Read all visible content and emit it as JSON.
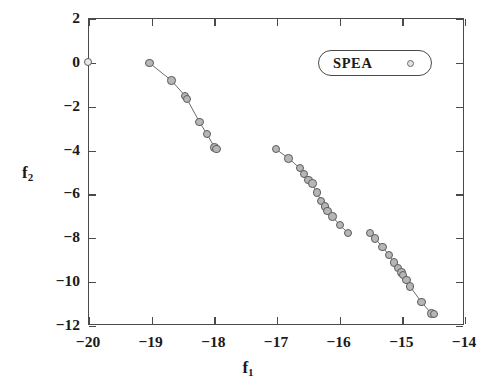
{
  "chart_data": {
    "type": "scatter",
    "title": "",
    "xlabel": "f_1",
    "ylabel": "f_2",
    "xlabel_base": "f",
    "xlabel_sub": "1",
    "ylabel_base": "f",
    "ylabel_sub": "2",
    "xlim": [
      -20,
      -14
    ],
    "ylim": [
      -12,
      2
    ],
    "xticks": [
      -20,
      -19,
      -18,
      -17,
      -16,
      -15,
      -14
    ],
    "xtick_labels": [
      "-20",
      "-19",
      "-18",
      "-17",
      "-16",
      "-15",
      "-14"
    ],
    "yticks": [
      2,
      0,
      -2,
      -4,
      -6,
      -8,
      -10,
      -12
    ],
    "ytick_labels": [
      "2",
      "0",
      "-2",
      "-4",
      "-6",
      "-8",
      "-10",
      "-12"
    ],
    "grid": false,
    "legend": {
      "position": "top-right",
      "entries": [
        {
          "name": "SPEA",
          "marker": "circle",
          "marker_color": "#e2e2e2"
        }
      ]
    },
    "marker_style": {
      "shape": "circle",
      "fill": "#b6b6b6",
      "edge": "#5d5d5d",
      "size_px": 8.4
    },
    "line_style": {
      "color": "#6b6b6b",
      "width": 1.0
    },
    "series": [
      {
        "name": "SPEA",
        "segments": [
          {
            "id": "isolated-origin",
            "connected": false,
            "points": [
              {
                "x": -20.0,
                "y": 0.0
              }
            ]
          },
          {
            "id": "segment-1",
            "connected": true,
            "points": [
              {
                "x": -19.02,
                "y": -0.05
              },
              {
                "x": -18.67,
                "y": -0.85
              },
              {
                "x": -18.45,
                "y": -1.55
              },
              {
                "x": -18.42,
                "y": -1.7
              },
              {
                "x": -18.22,
                "y": -2.75
              },
              {
                "x": -18.1,
                "y": -3.3
              },
              {
                "x": -17.98,
                "y": -3.9
              },
              {
                "x": -17.95,
                "y": -3.98
              }
            ]
          },
          {
            "id": "segment-2",
            "connected": true,
            "points": [
              {
                "x": -17.0,
                "y": -3.98
              },
              {
                "x": -16.8,
                "y": -4.4
              },
              {
                "x": -16.62,
                "y": -4.85
              },
              {
                "x": -16.55,
                "y": -5.1
              },
              {
                "x": -16.48,
                "y": -5.4
              },
              {
                "x": -16.42,
                "y": -5.55
              },
              {
                "x": -16.35,
                "y": -5.95
              },
              {
                "x": -16.28,
                "y": -6.35
              },
              {
                "x": -16.22,
                "y": -6.6
              },
              {
                "x": -16.18,
                "y": -6.8
              },
              {
                "x": -16.1,
                "y": -7.05
              },
              {
                "x": -15.98,
                "y": -7.45
              },
              {
                "x": -15.85,
                "y": -7.8
              }
            ]
          },
          {
            "id": "segment-3",
            "connected": true,
            "points": [
              {
                "x": -15.5,
                "y": -7.8
              },
              {
                "x": -15.42,
                "y": -8.05
              },
              {
                "x": -15.3,
                "y": -8.45
              },
              {
                "x": -15.2,
                "y": -8.8
              },
              {
                "x": -15.12,
                "y": -9.15
              },
              {
                "x": -15.05,
                "y": -9.4
              },
              {
                "x": -15.0,
                "y": -9.6
              },
              {
                "x": -14.97,
                "y": -9.72
              },
              {
                "x": -14.92,
                "y": -9.95
              },
              {
                "x": -14.86,
                "y": -10.25
              },
              {
                "x": -14.68,
                "y": -10.95
              },
              {
                "x": -14.52,
                "y": -11.48
              },
              {
                "x": -14.48,
                "y": -11.5
              }
            ]
          }
        ]
      }
    ]
  }
}
